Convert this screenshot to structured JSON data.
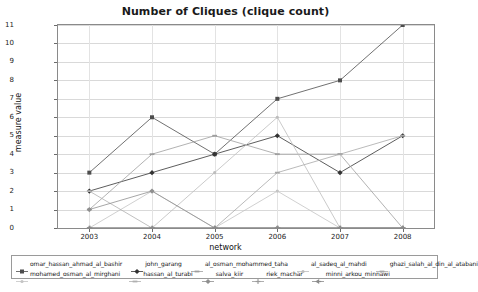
{
  "chart_data": {
    "type": "line",
    "title": "Number of Cliques (clique count)",
    "xlabel": "network",
    "ylabel": "measure value",
    "categories": [
      "2003",
      "2004",
      "2005",
      "2006",
      "2007",
      "2008"
    ],
    "ylim": [
      0,
      11
    ],
    "yticks": [
      "0",
      "1",
      "2",
      "3",
      "4",
      "5",
      "6",
      "7",
      "8",
      "9",
      "10",
      "11"
    ],
    "grid": true,
    "legend_position": "bottom",
    "series": [
      {
        "name": "omar_hassan_ahmad_al_bashir",
        "marker": "square",
        "color": "#4d4d4d",
        "values": [
          3,
          6,
          4,
          7,
          8,
          11
        ]
      },
      {
        "name": "john_garang",
        "marker": "diamond",
        "color": "#333333",
        "values": [
          2,
          3,
          4,
          5,
          3,
          5
        ]
      },
      {
        "name": "al_osman_mohammed_taha",
        "marker": "dash",
        "color": "#9e9e9e",
        "values": [
          1,
          4,
          5,
          4,
          4,
          0
        ]
      },
      {
        "name": "al_sadeq_al_mahdi",
        "marker": "dot",
        "color": "#bdbdbd",
        "values": [
          0,
          0,
          3,
          6,
          0,
          0
        ]
      },
      {
        "name": "ghazi_salah_al_din_al_atabani",
        "marker": "dash",
        "color": "#a8a8a8",
        "values": [
          0,
          0,
          0,
          3,
          4,
          5
        ]
      },
      {
        "name": "mohamed_osman_al_mirghani",
        "marker": "dot",
        "color": "#c4c4c4",
        "values": [
          0,
          2,
          0,
          2,
          0,
          0
        ]
      },
      {
        "name": "hassan_al_turabi",
        "marker": "dash",
        "color": "#b0b0b0",
        "values": [
          2,
          0,
          0,
          0,
          0,
          0
        ]
      },
      {
        "name": "salva_kiir",
        "marker": "diamond",
        "color": "#8f8f8f",
        "values": [
          1,
          2,
          0,
          0,
          0,
          0
        ]
      },
      {
        "name": "riek_machar",
        "marker": "plus",
        "color": "#9a9a9a",
        "values": [
          0,
          0,
          0,
          0,
          0,
          0
        ]
      },
      {
        "name": "minni_arkou_minnawi",
        "marker": "arrow",
        "color": "#8a8a8a",
        "values": [
          0,
          0,
          0,
          0,
          0,
          0
        ]
      }
    ]
  },
  "legend": {
    "rows": [
      [
        {
          "label": "omar_hassan_ahmad_al_bashir",
          "marker": "square",
          "color": "#4d4d4d"
        },
        {
          "label": "john_garang",
          "marker": "diamond",
          "color": "#333333"
        },
        {
          "label": "al_osman_mohammed_taha",
          "marker": "dash",
          "color": "#9e9e9e"
        },
        {
          "label": "al_sadeq_al_mahdi",
          "marker": "dot",
          "color": "#bdbdbd"
        },
        {
          "label": "ghazi_salah_al_din_al_atabani",
          "marker": "dash",
          "color": "#a8a8a8"
        }
      ],
      [
        {
          "label": "mohamed_osman_al_mirghani",
          "marker": "dot",
          "color": "#c4c4c4"
        },
        {
          "label": "hassan_al_turabi",
          "marker": "dash",
          "color": "#b0b0b0"
        },
        {
          "label": "salva_kiir",
          "marker": "diamond",
          "color": "#8f8f8f"
        },
        {
          "label": "riek_machar",
          "marker": "plus",
          "color": "#9a9a9a"
        },
        {
          "label": "minni_arkou_minnawi",
          "marker": "arrow",
          "color": "#8a8a8a"
        }
      ]
    ]
  }
}
